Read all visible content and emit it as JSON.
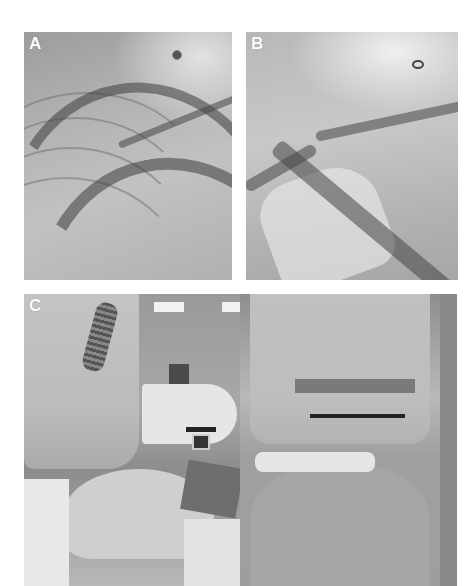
{
  "figure": {
    "panels": [
      {
        "id": "A",
        "label": "A",
        "content": "fluoroscopy image of chest with catheter/tubing shadows"
      },
      {
        "id": "B",
        "label": "B",
        "content": "fluoroscopy image of chest with catheter/tubing shadows"
      },
      {
        "id": "C",
        "label": "C",
        "content": "two photographs of patient under C-arm covered with plastic drape in operating room"
      }
    ]
  },
  "colors": {
    "background": "#ffffff",
    "label": "#ffffff"
  }
}
